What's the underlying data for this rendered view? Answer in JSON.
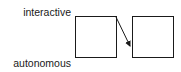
{
  "diagram": {
    "labels": {
      "top": "interactive",
      "bottom": "autonomous"
    },
    "nodes": [
      {
        "id": "box-left",
        "x": 75,
        "y": 16,
        "w": 41,
        "h": 41
      },
      {
        "id": "box-right",
        "x": 132,
        "y": 16,
        "w": 41,
        "h": 41
      }
    ],
    "edges": [
      {
        "from": "box-left",
        "to": "box-right",
        "x1": 116,
        "y1": 17,
        "x2": 131,
        "y2": 48
      }
    ],
    "colors": {
      "stroke": "#1a1a1a",
      "background": "#ffffff"
    }
  }
}
